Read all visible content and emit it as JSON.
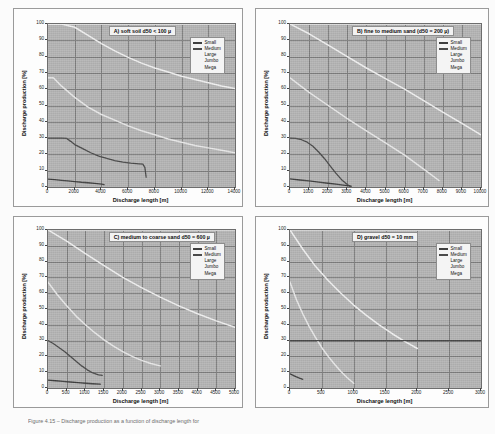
{
  "figure": {
    "caption_prefix": "Figure 4.15",
    "caption_text": "Figure 4.15 – Discharge production as a function of discharge length for"
  },
  "axes": {
    "ylabel": "Discharge production [%]",
    "xlabel": "Discharge length [m]",
    "yticks": [
      "0",
      "10",
      "20",
      "30",
      "40",
      "50",
      "60",
      "70",
      "80",
      "90",
      "100"
    ]
  },
  "legend": {
    "items": [
      {
        "label": "Small",
        "color": "#3f3f3f"
      },
      {
        "label": "Medium",
        "color": "#4a4a4a"
      },
      {
        "label": "Large",
        "color": "#e9e9e9"
      },
      {
        "label": "Jumbo",
        "color": "#f2f2f2"
      },
      {
        "label": "Mega",
        "color": "#fafafa"
      }
    ]
  },
  "colors": {
    "plot_background": "#b6b6b6",
    "gridline": "#7f7f7f",
    "axis": "#4a4a4a",
    "dark_curve": "#3f3f3f",
    "light_curve": "#f4f4f4"
  },
  "chart_data": [
    {
      "id": "A",
      "type": "line",
      "title": "A) soft soil d50 < 100 µ",
      "xlabel": "Discharge length [m]",
      "ylabel": "Discharge production [%]",
      "xlim": [
        0,
        14000
      ],
      "ylim": [
        0,
        100
      ],
      "xticks": [
        0,
        2000,
        4000,
        6000,
        8000,
        10000,
        12000,
        14000
      ],
      "yticks": [
        0,
        10,
        20,
        30,
        40,
        50,
        60,
        70,
        80,
        90,
        100
      ],
      "grid": true,
      "legend_position": "top-right",
      "series": [
        {
          "name": "Small",
          "color": "#3f3f3f",
          "x": [
            0,
            500,
            1000,
            1500,
            2000,
            2500,
            3000,
            3500,
            4000,
            4200
          ],
          "y": [
            4.8,
            4.5,
            4.1,
            3.7,
            3.3,
            2.9,
            2.6,
            2.2,
            1.8,
            1.5
          ]
        },
        {
          "name": "Medium",
          "color": "#4a4a4a",
          "x": [
            0,
            500,
            1000,
            1400,
            1700,
            2000,
            2600,
            3200,
            3800,
            4400,
            5000,
            5600,
            6200,
            6800,
            7100,
            7250,
            7350
          ],
          "y": [
            30,
            30,
            30,
            29.8,
            28,
            26,
            23.5,
            21,
            19,
            17.5,
            16.2,
            15.2,
            14.6,
            14.2,
            14.0,
            12.0,
            6.0
          ]
        },
        {
          "name": "Large",
          "color": "#e9e9e9",
          "x": [
            0,
            400,
            1000,
            2000,
            3000,
            4000,
            5000,
            6000,
            7000,
            8000,
            9000,
            10000,
            11000,
            12000,
            13000,
            14000
          ],
          "y": [
            67,
            67,
            62,
            55,
            49,
            44.5,
            41,
            37.5,
            34.5,
            32,
            29.5,
            27.5,
            25.5,
            24,
            22.5,
            21
          ]
        },
        {
          "name": "Jumbo",
          "color": "#f2f2f2",
          "x": [
            0,
            1000,
            2000,
            3000,
            4000,
            5000,
            6000,
            7000,
            8000,
            9000,
            10000,
            11000,
            12000,
            13000,
            14000
          ],
          "y": [
            100,
            100,
            98,
            93,
            88,
            83.5,
            79.5,
            76,
            73,
            70.5,
            68,
            66,
            64,
            62,
            60.5
          ]
        },
        {
          "name": "Mega",
          "color": "#fafafa",
          "x": [
            0,
            2000,
            4000,
            6000,
            8000,
            10000,
            12000,
            14000
          ],
          "y": [
            100,
            100,
            100,
            100,
            100,
            100,
            100,
            100
          ]
        }
      ]
    },
    {
      "id": "B",
      "type": "line",
      "title": "B) fine to medium sand (d50 = 200 µ)",
      "xlabel": "Discharge length [m]",
      "ylabel": "Discharge production [%]",
      "xlim": [
        0,
        10000
      ],
      "ylim": [
        0,
        100
      ],
      "xticks": [
        0,
        1000,
        2000,
        3000,
        4000,
        5000,
        6000,
        7000,
        8000,
        9000,
        10000
      ],
      "yticks": [
        0,
        10,
        20,
        30,
        40,
        50,
        60,
        70,
        80,
        90,
        100
      ],
      "grid": true,
      "legend_position": "top-right",
      "series": [
        {
          "name": "Small",
          "color": "#3f3f3f",
          "x": [
            0,
            500,
            1000,
            1500,
            2000,
            2500,
            3000,
            3200
          ],
          "y": [
            5.0,
            4.3,
            3.7,
            3.0,
            2.3,
            1.6,
            0.9,
            0.5
          ]
        },
        {
          "name": "Medium",
          "color": "#4a4a4a",
          "x": [
            0,
            300,
            600,
            900,
            1200,
            1500,
            1800,
            2100,
            2400,
            2700,
            3000,
            3200
          ],
          "y": [
            30,
            29.8,
            29,
            27.5,
            25,
            21.5,
            17.5,
            13,
            8.5,
            4.5,
            1.5,
            0
          ]
        },
        {
          "name": "Large",
          "color": "#e9e9e9",
          "x": [
            0,
            1000,
            2000,
            3000,
            4000,
            5000,
            6000,
            7000,
            7800
          ],
          "y": [
            67,
            58,
            50,
            42,
            34.5,
            27,
            19.5,
            11,
            4
          ]
        },
        {
          "name": "Jumbo",
          "color": "#f2f2f2",
          "x": [
            0,
            1000,
            2000,
            3000,
            4000,
            5000,
            6000,
            7000,
            8000,
            9000,
            10000
          ],
          "y": [
            100,
            94,
            87,
            80,
            73,
            66.5,
            60,
            53,
            46,
            39,
            32
          ]
        },
        {
          "name": "Mega",
          "color": "#fafafa",
          "x": [
            0,
            2000,
            4000,
            6000,
            8000,
            10000
          ],
          "y": [
            100,
            100,
            100,
            100,
            100,
            100
          ]
        }
      ]
    },
    {
      "id": "C",
      "type": "line",
      "title": "C) medium to coarse sand  d50 = 600 µ",
      "xlabel": "Discharge length [m]",
      "ylabel": "Discharge production [%]",
      "xlim": [
        0,
        5000
      ],
      "ylim": [
        0,
        100
      ],
      "xticks": [
        0,
        500,
        1000,
        1500,
        2000,
        2500,
        3000,
        3500,
        4000,
        4500,
        5000
      ],
      "yticks": [
        0,
        10,
        20,
        30,
        40,
        50,
        60,
        70,
        80,
        90,
        100
      ],
      "grid": true,
      "legend_position": "top-right",
      "series": [
        {
          "name": "Small",
          "color": "#3f3f3f",
          "x": [
            0,
            200,
            400,
            600,
            800,
            1000,
            1200,
            1400
          ],
          "y": [
            5.0,
            4.6,
            4.2,
            3.8,
            3.4,
            3.0,
            2.7,
            2.4
          ]
        },
        {
          "name": "Medium",
          "color": "#4a4a4a",
          "x": [
            0,
            150,
            300,
            450,
            600,
            750,
            900,
            1050,
            1200,
            1350,
            1450
          ],
          "y": [
            30,
            28,
            25.5,
            23,
            20,
            17,
            14,
            11.5,
            9.5,
            8.3,
            8.0
          ]
        },
        {
          "name": "Large",
          "color": "#e9e9e9",
          "x": [
            0,
            250,
            500,
            750,
            1000,
            1250,
            1500,
            1750,
            2000,
            2250,
            2500,
            2750,
            3000
          ],
          "y": [
            67,
            59,
            52,
            45.5,
            40,
            35,
            30.5,
            26.5,
            23,
            20,
            17.5,
            15.5,
            14
          ]
        },
        {
          "name": "Jumbo",
          "color": "#f2f2f2",
          "x": [
            0,
            500,
            1000,
            1500,
            2000,
            2500,
            3000,
            3500,
            4000,
            4500,
            5000
          ],
          "y": [
            100,
            93,
            85,
            77.5,
            70,
            63.5,
            57.5,
            52,
            47,
            42.5,
            38.5
          ]
        },
        {
          "name": "Mega",
          "color": "#fafafa",
          "x": [
            0,
            1000,
            2000,
            3000,
            4000,
            5000
          ],
          "y": [
            100,
            100,
            100,
            100,
            100,
            100
          ]
        }
      ]
    },
    {
      "id": "D",
      "type": "line",
      "title": "D) gravel d50 = 10 mm",
      "xlabel": "Discharge length [m]",
      "ylabel": "Discharge production [%]",
      "xlim": [
        0,
        3000
      ],
      "ylim": [
        0,
        100
      ],
      "xticks": [
        0,
        500,
        1000,
        1500,
        2000,
        2500,
        3000
      ],
      "yticks": [
        0,
        10,
        20,
        30,
        40,
        50,
        60,
        70,
        80,
        90,
        100
      ],
      "grid": true,
      "legend_position": "top-right",
      "series": [
        {
          "name": "Small",
          "color": "#3f3f3f",
          "x": [
            0,
            50,
            100,
            150,
            200
          ],
          "y": [
            9.0,
            8.0,
            7.0,
            6.2,
            5.5
          ]
        },
        {
          "name": "Medium",
          "color": "#4a4a4a",
          "x": [
            0,
            100,
            200,
            300,
            400,
            500,
            600,
            700,
            800,
            900,
            1000,
            1200,
            1500,
            2000,
            2500,
            3000
          ],
          "y": [
            30,
            30,
            30,
            30,
            30,
            30,
            30,
            30,
            30,
            30,
            30,
            30,
            30,
            30,
            30,
            30
          ]
        },
        {
          "name": "Large",
          "color": "#e9e9e9",
          "x": [
            0,
            100,
            200,
            300,
            400,
            500,
            600,
            700,
            800,
            900,
            1000
          ],
          "y": [
            67,
            56,
            47,
            39,
            32,
            25.5,
            20,
            15,
            10.5,
            6.5,
            3
          ]
        },
        {
          "name": "Jumbo",
          "color": "#f2f2f2",
          "x": [
            0,
            200,
            400,
            600,
            800,
            1000,
            1200,
            1400,
            1600,
            1800,
            2000
          ],
          "y": [
            100,
            88,
            77,
            68,
            60,
            52.5,
            46,
            40,
            34.5,
            29.5,
            25
          ]
        },
        {
          "name": "Mega",
          "color": "#fafafa",
          "x": [
            0,
            500,
            1000,
            1500,
            2000,
            2500,
            3000
          ],
          "y": [
            100,
            100,
            100,
            100,
            100,
            100,
            100
          ]
        }
      ]
    }
  ]
}
